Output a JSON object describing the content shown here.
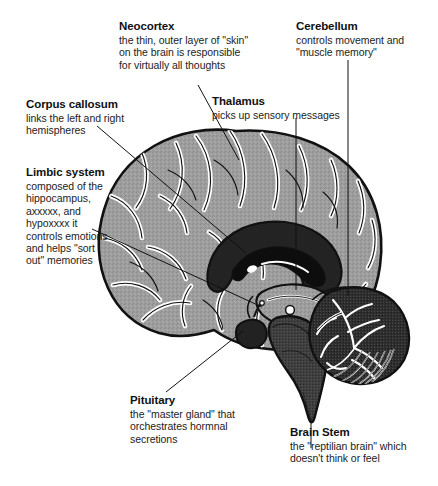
{
  "figure": {
    "kind": "brain-sagittal-cross-section",
    "colors": {
      "background": "#ffffff",
      "ink": "#111111",
      "cortex_fill": "#9a9a9a",
      "sulci_highlight": "#ffffff",
      "brainstem_fill": "#3c3c3c",
      "cerebellum_fill": "#2e2e2e",
      "corpus_callosum_fill": "#242424",
      "leader_line": "#111111"
    }
  },
  "callouts": [
    {
      "id": "neocortex",
      "title": "Neocortex",
      "lines": [
        "the thin, outer layer of \"skin\"",
        "on the brain is responsible",
        "for virtually all thoughts"
      ]
    },
    {
      "id": "cerebellum",
      "title": "Cerebellum",
      "lines": [
        "controls movement and",
        "\"muscle memory\""
      ]
    },
    {
      "id": "corpus-callosum",
      "title": "Corpus callosum",
      "lines": [
        "links the left and right",
        "hemispheres"
      ]
    },
    {
      "id": "thalamus",
      "title": "Thalamus",
      "lines": [
        "picks up sensory messages"
      ]
    },
    {
      "id": "limbic-system",
      "title": "Limbic system",
      "lines": [
        "composed of the",
        "hippocampus,",
        "axxxxx, and",
        "hypoxxxx it",
        "controls emotions",
        "and helps \"sort",
        "out\" memories"
      ]
    },
    {
      "id": "pituitary",
      "title": "Pituitary",
      "lines": [
        "the \"master gland\" that",
        "orchestrates hormnal",
        "secretions"
      ]
    },
    {
      "id": "brain-stem",
      "title": "Brain Stem",
      "lines": [
        "the \"reptilian brain\" which",
        "doesn't think or feel"
      ]
    }
  ]
}
